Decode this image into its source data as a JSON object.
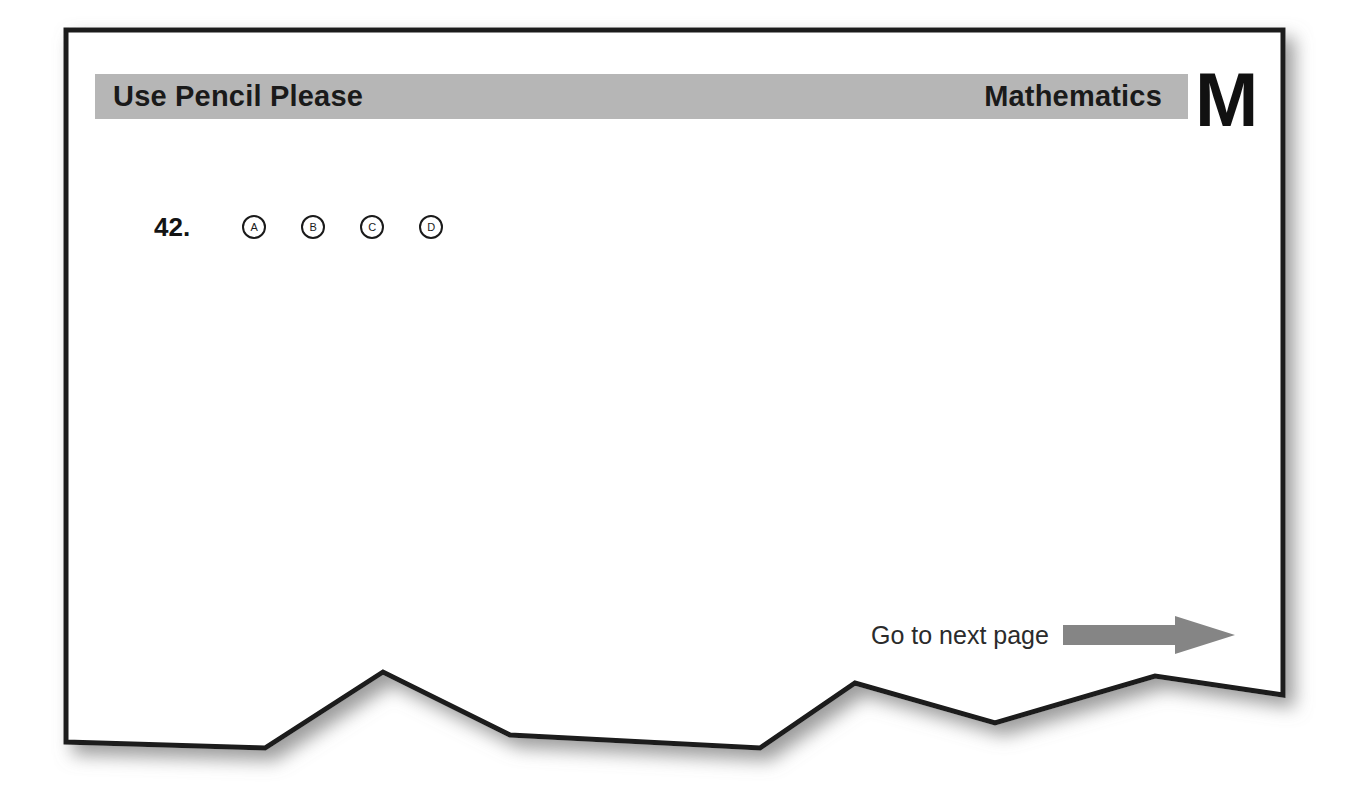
{
  "page": {
    "background_color": "#ffffff",
    "sheet_color": "#ffffff",
    "border_color": "#1a1a1a",
    "shadow_color": "#9a9a9a"
  },
  "header": {
    "band_color": "#b6b6b6",
    "instruction": "Use Pencil Please",
    "subject": "Mathematics",
    "subject_letter": "M"
  },
  "question": {
    "number": "42.",
    "options": [
      {
        "label": "A",
        "selected": false
      },
      {
        "label": "B",
        "selected": false
      },
      {
        "label": "C",
        "selected": false
      },
      {
        "label": "D",
        "selected": false
      }
    ]
  },
  "footer": {
    "next_page_label": "Go to next page",
    "arrow_icon": "right-arrow-icon",
    "arrow_color": "#858585"
  }
}
